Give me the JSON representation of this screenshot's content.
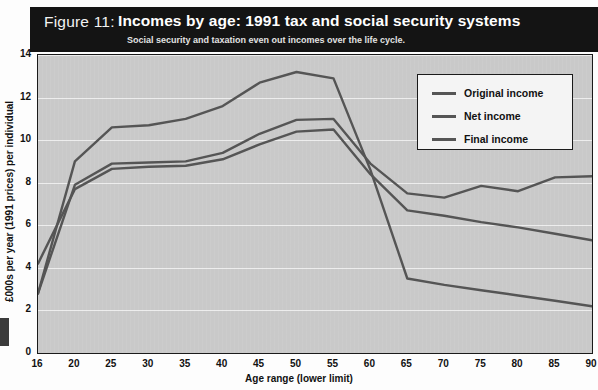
{
  "figure": {
    "number_label": "Figure 11:",
    "title": "Incomes by age: 1991 tax and social security systems",
    "subtitle": "Social  security and taxation even out incomes over the life cycle."
  },
  "colors": {
    "header_bg": "#141414",
    "plot_bg": "#c9c9c9",
    "gridline": "#ededed",
    "line": "#555555",
    "legend_bg": "#f4f4f4",
    "axis": "#1a1a1a"
  },
  "legend": {
    "position": "top-right",
    "items": [
      {
        "label": "Original income",
        "color": "#555555"
      },
      {
        "label": "Net income",
        "color": "#555555"
      },
      {
        "label": "Final income",
        "color": "#555555"
      }
    ]
  },
  "axes": {
    "y_label": "£000s per year (1991 prices) per individual",
    "x_label": "Age range (lower limit)",
    "y_ticks": [
      "0",
      "2",
      "4",
      "6",
      "8",
      "10",
      "12",
      "14"
    ],
    "x_ticks": [
      "16",
      "20",
      "25",
      "30",
      "35",
      "40",
      "45",
      "50",
      "55",
      "60",
      "65",
      "70",
      "75",
      "80",
      "85",
      "90"
    ]
  },
  "chart_data": {
    "type": "line",
    "title": "Incomes by age: 1991 tax and social security systems",
    "subtitle": "Social  security and taxation even out incomes over the life cycle.",
    "xlabel": "Age range (lower limit)",
    "ylabel": "£000s per year (1991 prices) per individual",
    "categories": [
      16,
      20,
      25,
      30,
      35,
      40,
      45,
      50,
      55,
      60,
      65,
      70,
      75,
      80,
      85,
      90
    ],
    "ylim": [
      0,
      14
    ],
    "xlim": [
      16,
      90
    ],
    "grid": true,
    "legend_position": "top-right",
    "series": [
      {
        "name": "Original income",
        "color": "#555555",
        "values": [
          2.8,
          9.0,
          10.6,
          10.7,
          11.0,
          11.6,
          12.7,
          13.2,
          12.9,
          8.6,
          3.5,
          3.2,
          2.95,
          2.7,
          2.45,
          2.2
        ]
      },
      {
        "name": "Net income",
        "color": "#555555",
        "values": [
          4.2,
          7.7,
          8.65,
          8.75,
          8.8,
          9.1,
          9.8,
          10.4,
          10.5,
          8.4,
          6.7,
          6.45,
          6.15,
          5.9,
          5.6,
          5.3
        ]
      },
      {
        "name": "Final income",
        "color": "#555555",
        "values": [
          2.8,
          7.9,
          8.9,
          8.95,
          9.0,
          9.4,
          10.3,
          10.95,
          11.0,
          8.9,
          7.5,
          7.3,
          7.85,
          7.6,
          8.25,
          8.3
        ]
      }
    ]
  }
}
